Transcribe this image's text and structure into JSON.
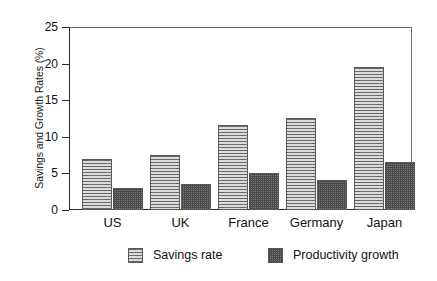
{
  "chart_data": {
    "type": "bar",
    "title": "",
    "subtitle": "",
    "xlabel": "",
    "ylabel": "Savings and Growth Rates (%)",
    "categories": [
      "US",
      "UK",
      "France",
      "Germany",
      "Japan"
    ],
    "series": [
      {
        "name": "Savings rate",
        "pattern": "horizontal-lines",
        "values": [
          7.0,
          7.5,
          11.6,
          12.6,
          19.6
        ]
      },
      {
        "name": "Productivity growth",
        "pattern": "crosshatch",
        "values": [
          3.0,
          3.5,
          5.0,
          4.1,
          6.6
        ]
      }
    ],
    "ylim": [
      0,
      25
    ],
    "yticks": [
      0,
      5,
      10,
      15,
      20,
      25
    ],
    "ytick_labels": [
      "0",
      "5",
      "10",
      "15",
      "20",
      "25"
    ],
    "grid": false,
    "legend_position": "bottom-center",
    "legend_entries": [
      "Savings rate",
      "Productivity growth"
    ]
  },
  "colors": {
    "savings_fill": "#c9c9c9",
    "savings_hatch": "#6a6a6a",
    "growth_fill": "#7c7c7c",
    "growth_hatch": "#4a4a4a",
    "axis": "#2b2b2b",
    "frame": "#6f6f6f",
    "text": "#111111",
    "background": "#ffffff"
  }
}
